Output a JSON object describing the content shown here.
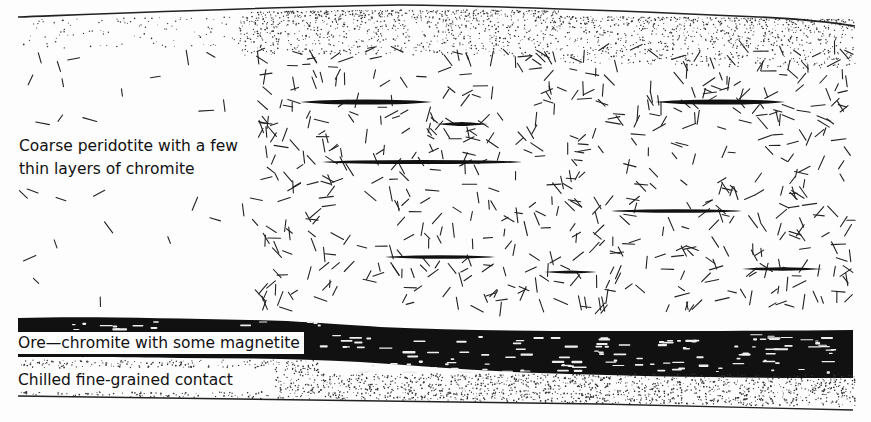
{
  "diagram": {
    "colors": {
      "ink": "#111111",
      "background": "#fdfdfd",
      "stipple": "#333333"
    },
    "labels": {
      "peridotite_line1": "Coarse peridotite with a few",
      "peridotite_line2": "thin layers of chromite",
      "ore": "Ore—chromite with some magnetite",
      "contact": "Chilled fine-grained contact"
    },
    "layers": [
      {
        "name": "upper-chilled-contact",
        "type": "stipple",
        "top": 18,
        "bottom": 70
      },
      {
        "name": "coarse-peridotite",
        "type": "crystal-dashes",
        "top": 60,
        "bottom": 318
      },
      {
        "name": "ore-chromite-magnetite",
        "type": "solid-black",
        "top": 318,
        "bottom": 378
      },
      {
        "name": "lower-chilled-contact",
        "type": "stipple",
        "top": 360,
        "bottom": 405
      }
    ],
    "chromite_seams": [
      {
        "x1": 300,
        "x2": 432,
        "y": 102,
        "thickness": 5
      },
      {
        "x1": 436,
        "x2": 488,
        "y": 124,
        "thickness": 4
      },
      {
        "x1": 322,
        "x2": 522,
        "y": 162,
        "thickness": 4
      },
      {
        "x1": 655,
        "x2": 785,
        "y": 102,
        "thickness": 5
      },
      {
        "x1": 611,
        "x2": 742,
        "y": 211,
        "thickness": 3.5
      },
      {
        "x1": 385,
        "x2": 495,
        "y": 257,
        "thickness": 3.5
      },
      {
        "x1": 544,
        "x2": 597,
        "y": 272,
        "thickness": 3
      },
      {
        "x1": 742,
        "x2": 823,
        "y": 269,
        "thickness": 3.5
      }
    ]
  }
}
